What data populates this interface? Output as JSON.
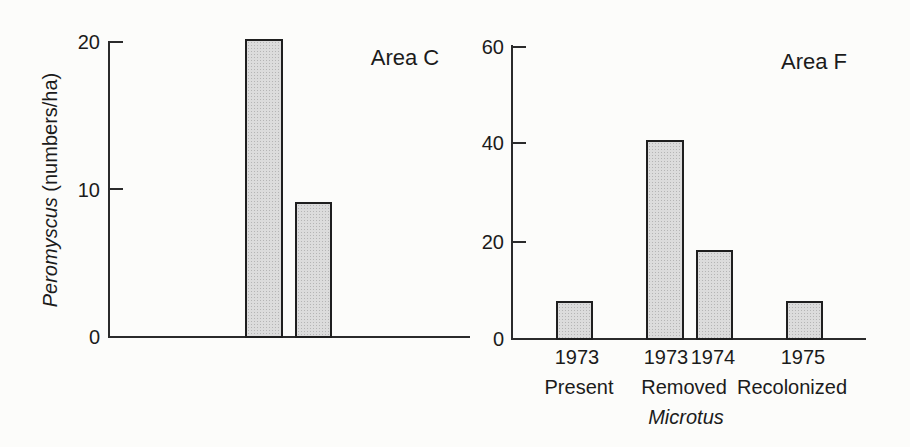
{
  "figure": {
    "background": "#fcfcfa",
    "bar_fill": "#dcdcdc",
    "bar_stipple_dot": "#b5b5b5",
    "bar_border": "#1f1f1f",
    "axis_color": "#2b2b2b",
    "text_color": "#1b1b1b"
  },
  "panel_c": {
    "title": "Area C",
    "ylabel_species": "Peromyscus",
    "ylabel_units": " (numbers/ha)",
    "yticks": [
      "20",
      "10",
      "0"
    ]
  },
  "panel_f": {
    "title": "Area F",
    "yticks": [
      "60",
      "40",
      "20",
      "0"
    ],
    "year_labels": [
      "1973",
      "1973",
      "1974",
      "1975"
    ],
    "treatment_labels": [
      "Present",
      "Removed",
      "Recolonized"
    ],
    "species_label": "Microtus"
  },
  "chart_data": [
    {
      "type": "bar",
      "title": "Area C",
      "ylabel": "Peromyscus (numbers/ha)",
      "xlabel": "",
      "categories": [
        "bar-1",
        "bar-2"
      ],
      "values": [
        20.3,
        9.2
      ],
      "ylim": [
        0,
        20
      ],
      "yticks": [
        0,
        10,
        20
      ],
      "grid": false,
      "legend": false
    },
    {
      "type": "bar",
      "title": "Area F",
      "ylabel": "",
      "xlabel": "Microtus",
      "categories": [
        "1973 Present",
        "1973 Removed",
        "1974 Removed",
        "1975 Recolonized"
      ],
      "values": [
        8,
        41,
        18.5,
        8
      ],
      "ylim": [
        0,
        60
      ],
      "yticks": [
        0,
        20,
        40,
        60
      ],
      "grid": false,
      "legend": false
    }
  ]
}
